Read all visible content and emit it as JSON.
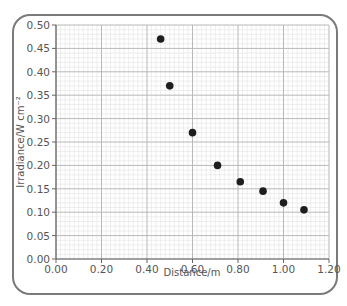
{
  "chart_data": {
    "type": "scatter",
    "title": "",
    "xlabel": "Distance/m",
    "ylabel": "Irradiance/W cm⁻²",
    "xlim": [
      0,
      1.2
    ],
    "ylim": [
      0,
      0.5
    ],
    "x_ticks": [
      "0.00",
      "0.20",
      "0.40",
      "0.60",
      "0.80",
      "1.00",
      "1.20"
    ],
    "y_ticks": [
      "0.00",
      "0.05",
      "0.10",
      "0.15",
      "0.20",
      "0.25",
      "0.30",
      "0.35",
      "0.40",
      "0.45",
      "0.50"
    ],
    "grid": true,
    "legend": null,
    "series": [
      {
        "name": "Irradiance",
        "points": [
          {
            "x": 0.46,
            "y": 0.47
          },
          {
            "x": 0.5,
            "y": 0.37
          },
          {
            "x": 0.6,
            "y": 0.27
          },
          {
            "x": 0.71,
            "y": 0.2
          },
          {
            "x": 0.81,
            "y": 0.165
          },
          {
            "x": 0.91,
            "y": 0.145
          },
          {
            "x": 1.0,
            "y": 0.12
          },
          {
            "x": 1.09,
            "y": 0.105
          }
        ]
      }
    ]
  },
  "colors": {
    "frame": "#7a7a7a",
    "grid_minor": "#e2e2e2",
    "grid_major": "#b8b8b8",
    "axis": "#666666",
    "marker": "#1e1e1e"
  }
}
